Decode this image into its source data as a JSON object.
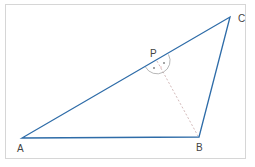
{
  "diagram": {
    "type": "geometry-triangle",
    "colors": {
      "triangle_stroke": "#2e6ca8",
      "dashed_line": "#c8a8a8",
      "angle_arc": "#888888",
      "frame": "#d6d6d6",
      "label": "#444444"
    },
    "vertices": [
      {
        "name": "A",
        "label": "A"
      },
      {
        "name": "B",
        "label": "B"
      },
      {
        "name": "C",
        "label": "C"
      }
    ],
    "point_on_side": {
      "name": "P",
      "label": "P",
      "on_segment": "AC"
    },
    "segments": [
      {
        "from": "A",
        "to": "B",
        "style": "solid"
      },
      {
        "from": "B",
        "to": "C",
        "style": "solid"
      },
      {
        "from": "C",
        "to": "A",
        "style": "solid"
      },
      {
        "from": "P",
        "to": "B",
        "style": "dashed"
      }
    ],
    "angle_marks": {
      "at": "P",
      "description": "two angles at P marked with dots (angle APB and angle BPC)"
    }
  }
}
